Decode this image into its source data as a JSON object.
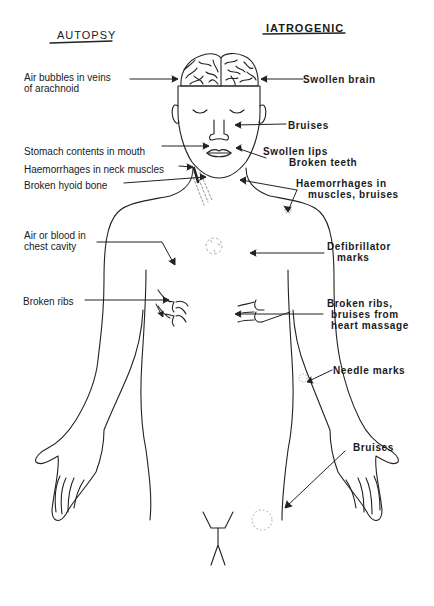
{
  "headers": {
    "left": "AUTOPSY",
    "right": "IATROGENIC"
  },
  "autopsy_labels": [
    {
      "line1": "Air bubbles in veins",
      "line2": "of arachnoid"
    },
    {
      "line1": "Stomach contents in mouth"
    },
    {
      "line1": "Haemorrhages in neck muscles"
    },
    {
      "line1": "Broken hyoid bone"
    },
    {
      "line1": "Air or blood in",
      "line2": "chest cavity"
    },
    {
      "line1": "Broken ribs"
    }
  ],
  "iatrogenic_labels": [
    {
      "line1": "Swollen brain"
    },
    {
      "line1": "Bruises"
    },
    {
      "line1": "Swollen lips",
      "line2": "Broken teeth"
    },
    {
      "line1": "Haemorrhages  in",
      "line2": "muscles, bruises"
    },
    {
      "line1": "Defibrillator",
      "line2": "marks"
    },
    {
      "line1": "Broken ribs,",
      "line2": "bruises from",
      "line3": "heart massage"
    },
    {
      "line1": "Needle marks"
    },
    {
      "line1": "Bruises"
    }
  ],
  "colors": {
    "line": "#222222",
    "background": "#ffffff",
    "mark": "#9a9a9a"
  }
}
